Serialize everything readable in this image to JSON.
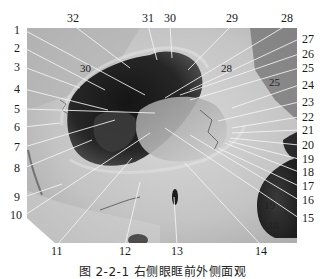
{
  "figure": {
    "caption": "图 2-2-1   右侧眼眶前外侧面观",
    "photo_bounds": {
      "x": 27,
      "y": 28,
      "w": 270,
      "h": 215
    }
  },
  "labels": {
    "left": [
      {
        "n": "1",
        "x": 14,
        "y": 34,
        "tx": 145,
        "ty": 95
      },
      {
        "n": "2",
        "x": 14,
        "y": 52,
        "tx": 105,
        "ty": 90
      },
      {
        "n": "3",
        "x": 14,
        "y": 71,
        "tx": 80,
        "ty": 88
      },
      {
        "n": "4",
        "x": 14,
        "y": 93,
        "tx": 108,
        "ty": 110
      },
      {
        "n": "5",
        "x": 14,
        "y": 113,
        "tx": 155,
        "ty": 113
      },
      {
        "n": "6",
        "x": 14,
        "y": 131,
        "tx": 60,
        "ty": 123
      },
      {
        "n": "7",
        "x": 14,
        "y": 151,
        "tx": 115,
        "ty": 120
      },
      {
        "n": "8",
        "x": 14,
        "y": 172,
        "tx": 92,
        "ty": 140
      },
      {
        "n": "9",
        "x": 14,
        "y": 201,
        "tx": 62,
        "ty": 184
      },
      {
        "n": "10",
        "x": 10,
        "y": 219,
        "tx": 150,
        "ty": 133
      }
    ],
    "right": [
      {
        "n": "27",
        "x": 302,
        "y": 43,
        "tx": 190,
        "ty": 90
      },
      {
        "n": "26",
        "x": 302,
        "y": 58,
        "tx": 180,
        "ty": 95
      },
      {
        "n": "25",
        "x": 302,
        "y": 72,
        "tx": 190,
        "ty": 100
      },
      {
        "n": "24",
        "x": 302,
        "y": 89,
        "tx": 232,
        "ty": 108
      },
      {
        "n": "23",
        "x": 302,
        "y": 106,
        "tx": 218,
        "ty": 121
      },
      {
        "n": "22",
        "x": 302,
        "y": 121,
        "tx": 232,
        "ty": 128
      },
      {
        "n": "21",
        "x": 302,
        "y": 134,
        "tx": 232,
        "ty": 133
      },
      {
        "n": "20",
        "x": 302,
        "y": 149,
        "tx": 230,
        "ty": 138
      },
      {
        "n": "19",
        "x": 302,
        "y": 163,
        "tx": 228,
        "ty": 141
      },
      {
        "n": "18",
        "x": 302,
        "y": 176,
        "tx": 225,
        "ty": 143
      },
      {
        "n": "17",
        "x": 302,
        "y": 190,
        "tx": 218,
        "ty": 148
      },
      {
        "n": "16",
        "x": 302,
        "y": 204,
        "tx": 190,
        "ty": 135
      },
      {
        "n": "15",
        "x": 302,
        "y": 222,
        "tx": 165,
        "ty": 128
      }
    ],
    "top": [
      {
        "n": "32",
        "x": 67,
        "y": 22,
        "tx": 130,
        "ty": 68
      },
      {
        "n": "31",
        "x": 142,
        "y": 22,
        "tx": 157,
        "ty": 60
      },
      {
        "n": "30",
        "x": 164,
        "y": 22,
        "tx": 172,
        "ty": 58
      },
      {
        "n": "29",
        "x": 226,
        "y": 22,
        "tx": 188,
        "ty": 70
      },
      {
        "n": "28",
        "x": 281,
        "y": 22,
        "tx": 165,
        "ty": 98
      }
    ],
    "bottom": [
      {
        "n": "11",
        "x": 51,
        "y": 255,
        "tx": 132,
        "ty": 158
      },
      {
        "n": "12",
        "x": 119,
        "y": 255,
        "tx": 140,
        "ty": 182
      },
      {
        "n": "13",
        "x": 171,
        "y": 255,
        "tx": 174,
        "ty": 197
      },
      {
        "n": "14",
        "x": 255,
        "y": 255,
        "tx": 185,
        "ty": 163
      }
    ],
    "inline": [
      {
        "n": "30",
        "x": 80,
        "y": 72
      },
      {
        "n": "28",
        "x": 221,
        "y": 72
      },
      {
        "n": "25",
        "x": 269,
        "y": 86
      },
      {
        "n": "19",
        "x": 264,
        "y": 209
      },
      {
        "n": "18",
        "x": 268,
        "y": 229
      }
    ]
  }
}
